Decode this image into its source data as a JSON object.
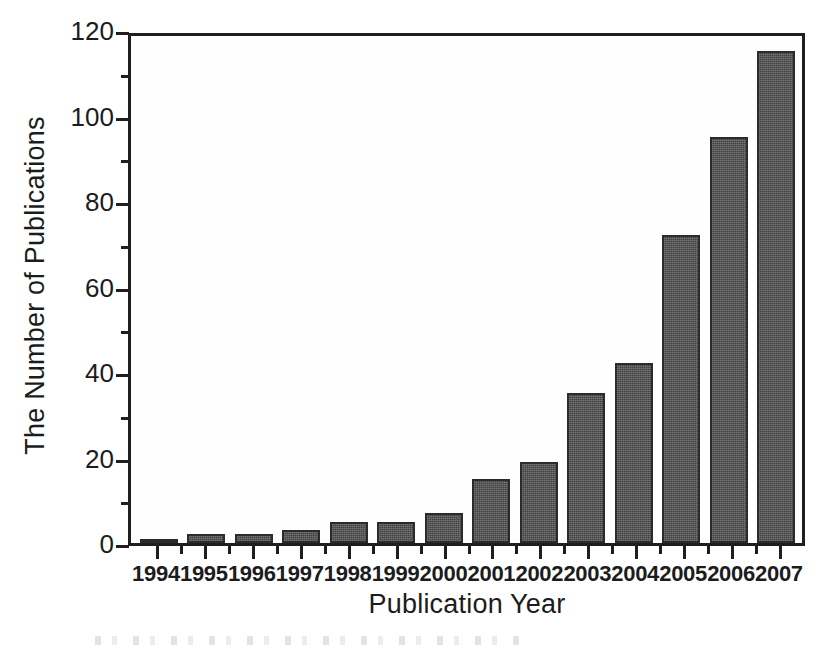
{
  "chart_data": {
    "type": "bar",
    "title": "",
    "xlabel": "Publication Year",
    "ylabel": "The Number of Publications",
    "categories": [
      "1994",
      "1995",
      "1996",
      "1997",
      "1998",
      "1999",
      "2000",
      "2001",
      "2002",
      "2003",
      "2004",
      "2005",
      "2006",
      "2007"
    ],
    "values": [
      1,
      2,
      2,
      3,
      5,
      5,
      7,
      15,
      19,
      35,
      42,
      72,
      95,
      115
    ],
    "ylim": [
      0,
      120
    ],
    "ytick_labels": [
      "0",
      "20",
      "40",
      "60",
      "80",
      "100",
      "120"
    ],
    "ytick_values": [
      0,
      20,
      40,
      60,
      80,
      100,
      120
    ],
    "yminor_tick_values": [
      10,
      30,
      50,
      70,
      90,
      110
    ],
    "grid": false,
    "legend": null,
    "bar_color": "#555555",
    "bar_edge_color": "#2b2b2b",
    "axis_color": "#1f1f1f",
    "background_color": "#ffffff"
  }
}
